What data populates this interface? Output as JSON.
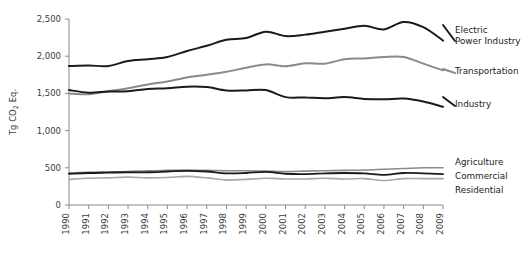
{
  "chart_data": {
    "type": "line",
    "title": "",
    "xlabel": "",
    "ylabel": "Tg CO2 Eq.",
    "ylabel_parts": {
      "pre": "Tg CO",
      "sub": "2",
      "post": " Eq."
    },
    "x": [
      1990,
      1991,
      1992,
      1993,
      1994,
      1995,
      1996,
      1997,
      1998,
      1999,
      2000,
      2001,
      2002,
      2003,
      2004,
      2005,
      2006,
      2007,
      2008,
      2009
    ],
    "xtick_labels": [
      "1990",
      "1991",
      "1992",
      "1993",
      "1994",
      "1995",
      "1996",
      "1997",
      "1998",
      "1999",
      "2000",
      "2001",
      "2002",
      "2003",
      "2004",
      "2005",
      "2006",
      "2007",
      "2008",
      "2009"
    ],
    "ytick_labels": [
      "0",
      "500",
      "1,000",
      "1,500",
      "2,000",
      "2,500"
    ],
    "yticks": [
      0,
      500,
      1000,
      1500,
      2000,
      2500
    ],
    "ylim": [
      0,
      2500
    ],
    "xlim": [
      1990,
      2009
    ],
    "grid": false,
    "legend_position": "right-inline",
    "series": [
      {
        "name": "Electric Power Industry",
        "color": "#1a1a1a",
        "width": 2.0,
        "label_lines": [
          "Electric",
          "Power Industry"
        ],
        "values": [
          1868,
          1875,
          1868,
          1935,
          1960,
          1990,
          2070,
          2140,
          2220,
          2245,
          2330,
          2270,
          2290,
          2330,
          2370,
          2410,
          2360,
          2460,
          2390,
          2210
        ]
      },
      {
        "name": "Transportation",
        "color": "#8a8a8a",
        "width": 2.0,
        "label_lines": [
          "Transportation"
        ],
        "values": [
          1500,
          1490,
          1530,
          1570,
          1620,
          1660,
          1715,
          1750,
          1790,
          1845,
          1890,
          1865,
          1905,
          1900,
          1960,
          1970,
          1990,
          1990,
          1900,
          1810
        ]
      },
      {
        "name": "Industry",
        "color": "#1a1a1a",
        "width": 2.0,
        "label_lines": [
          "Industry"
        ],
        "values": [
          1545,
          1510,
          1525,
          1530,
          1560,
          1570,
          1590,
          1585,
          1540,
          1540,
          1545,
          1450,
          1445,
          1435,
          1450,
          1425,
          1420,
          1430,
          1390,
          1320
        ]
      },
      {
        "name": "Agriculture",
        "color": "#8a8a8a",
        "width": 1.6,
        "label_lines": [
          "Agriculture"
        ],
        "values": [
          430,
          440,
          445,
          450,
          460,
          465,
          470,
          465,
          460,
          460,
          455,
          450,
          455,
          460,
          465,
          470,
          480,
          490,
          500,
          500
        ]
      },
      {
        "name": "Commercial",
        "color": "#1a1a1a",
        "width": 1.8,
        "label_lines": [
          "Commercial"
        ],
        "values": [
          420,
          430,
          435,
          440,
          440,
          450,
          460,
          450,
          425,
          430,
          445,
          420,
          415,
          425,
          430,
          425,
          405,
          430,
          425,
          415
        ]
      },
      {
        "name": "Residential",
        "color": "#a8a8a8",
        "width": 1.6,
        "label_lines": [
          "Residential"
        ],
        "values": [
          345,
          360,
          365,
          375,
          365,
          370,
          385,
          365,
          335,
          345,
          360,
          350,
          350,
          360,
          350,
          355,
          330,
          355,
          355,
          355
        ]
      }
    ],
    "legend_entries": [
      {
        "name": "Electric Power Industry",
        "lines": [
          "Electric",
          "Power Industry"
        ],
        "color": "#1a1a1a"
      },
      {
        "name": "Transportation",
        "lines": [
          "Transportation"
        ],
        "color": "#8a8a8a"
      },
      {
        "name": "Industry",
        "lines": [
          "Industry"
        ],
        "color": "#1a1a1a"
      },
      {
        "name": "Agriculture",
        "lines": [
          "Agriculture"
        ],
        "color": "#8a8a8a"
      },
      {
        "name": "Commercial",
        "lines": [
          "Commercial"
        ],
        "color": "#1a1a1a"
      },
      {
        "name": "Residential",
        "lines": [
          "Residential"
        ],
        "color": "#a8a8a8"
      }
    ]
  }
}
